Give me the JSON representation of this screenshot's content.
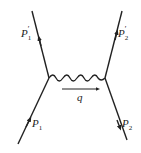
{
  "diagram": {
    "type": "feynman-diagram",
    "colors": {
      "line": "#222222",
      "background": "#ffffff"
    },
    "particles": [
      {
        "id": "p1",
        "label_main": "P",
        "label_sub": "1",
        "label_prime": "",
        "role": "incoming-left"
      },
      {
        "id": "p1prime",
        "label_main": "P",
        "label_sub": "1",
        "label_prime": "′",
        "role": "outgoing-left"
      },
      {
        "id": "p2",
        "label_main": "P",
        "label_sub": "2",
        "label_prime": "",
        "role": "outgoing-right"
      },
      {
        "id": "p2prime",
        "label_main": "P",
        "label_sub": "2",
        "label_prime": "′",
        "role": "incoming-right"
      }
    ],
    "propagator": {
      "style": "wavy",
      "momentum_label": "q"
    }
  }
}
